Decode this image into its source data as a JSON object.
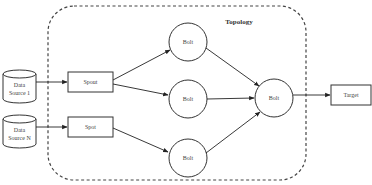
{
  "diagram": {
    "title": "Topology",
    "nodes": {
      "source1": {
        "label_line1": "Data",
        "label_line2": "Source 1",
        "shape": "cylinder"
      },
      "sourceN": {
        "label_line1": "Data",
        "label_line2": "Source N",
        "shape": "cylinder"
      },
      "spout1": {
        "label": "Spout",
        "shape": "rectangle"
      },
      "spout2": {
        "label": "Spot",
        "shape": "rectangle"
      },
      "bolt_top": {
        "label": "Bolt",
        "shape": "circle"
      },
      "bolt_mid": {
        "label": "Bolt",
        "shape": "circle"
      },
      "bolt_bottom": {
        "label": "Bolt",
        "shape": "circle"
      },
      "bolt_final": {
        "label": "Bolt",
        "shape": "circle"
      },
      "target": {
        "label": "Target",
        "shape": "rectangle"
      }
    },
    "edges": [
      {
        "from": "Data Source 1",
        "to": "Spout"
      },
      {
        "from": "Data Source N",
        "to": "Spot"
      },
      {
        "from": "Spout",
        "to": "Bolt (top)"
      },
      {
        "from": "Spout",
        "to": "Bolt (middle)"
      },
      {
        "from": "Spot",
        "to": "Bolt (bottom)"
      },
      {
        "from": "Bolt (top)",
        "to": "Bolt (final)"
      },
      {
        "from": "Bolt (middle)",
        "to": "Bolt (final)"
      },
      {
        "from": "Bolt (bottom)",
        "to": "Bolt (final)"
      },
      {
        "from": "Bolt (final)",
        "to": "Target"
      }
    ],
    "colors": {
      "stroke": "#333333",
      "text": "#444444",
      "background": "#ffffff"
    }
  }
}
